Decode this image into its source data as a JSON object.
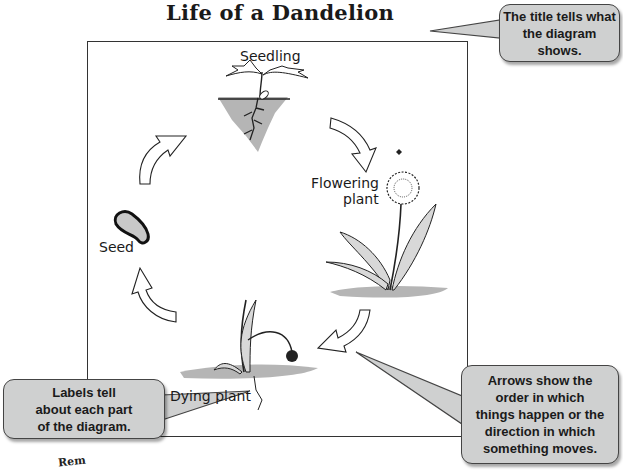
{
  "title": "Life of a Dandelion",
  "diagram": {
    "type": "life-cycle",
    "stages": [
      {
        "id": "seedling",
        "label": "Seedling"
      },
      {
        "id": "flowering",
        "label_line1": "Flowering",
        "label_line2": "plant"
      },
      {
        "id": "dying",
        "label": "Dying plant"
      },
      {
        "id": "seed",
        "label": "Seed"
      }
    ],
    "arrow_order": [
      "Seedling",
      "Flowering plant",
      "Dying plant",
      "Seed",
      "Seedling"
    ]
  },
  "callouts": {
    "title_note": {
      "line1": "The title tells what",
      "line2": "the diagram shows."
    },
    "labels_note": {
      "line1": "Labels tell",
      "line2": "about each part",
      "line3": "of the diagram."
    },
    "arrows_note": {
      "line1": "Arrows show the",
      "line2": "order in which",
      "line3": "things happen or the",
      "line4": "direction in which",
      "line5": "something moves."
    }
  },
  "footer_fragment": "Rem",
  "colors": {
    "callout_fill": "#cfd0d0",
    "ground_gray": "#b5b5b5",
    "ink": "#1a1a1a"
  }
}
